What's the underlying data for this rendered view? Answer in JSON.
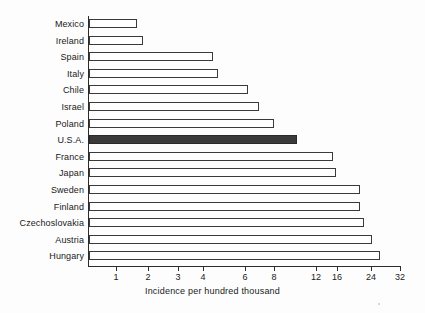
{
  "chart_data": {
    "type": "bar",
    "orientation": "horizontal",
    "title": "",
    "xlabel": "Incidence per hundred thousand",
    "ylabel": "",
    "xscale": "log",
    "xlim": [
      0.9,
      32
    ],
    "grid": false,
    "legend": null,
    "tick_labels": [
      "1",
      "2",
      "3",
      "4",
      "6",
      "8",
      "12",
      "16",
      "24",
      "32"
    ],
    "tick_values": [
      1,
      2,
      3,
      4,
      6,
      8,
      12,
      16,
      24,
      32
    ],
    "tick_px": [
      116,
      148,
      178,
      203,
      245,
      274,
      316,
      337,
      371,
      400
    ],
    "categories": [
      "Mexico",
      "Ireland",
      "Spain",
      "Italy",
      "Chile",
      "Israel",
      "Poland",
      "U.S.A.",
      "France",
      "Japan",
      "Sweden",
      "Finland",
      "Czechoslovakia",
      "Austria",
      "Hungary"
    ],
    "values": [
      1.6,
      1.8,
      4.0,
      4.15,
      6.1,
      6.45,
      7.85,
      10.5,
      14.5,
      15.6,
      20.5,
      20.5,
      22.5,
      23.8,
      25.3
    ],
    "bar_end_px": [
      137,
      143,
      213,
      218,
      248,
      259,
      274,
      297,
      333,
      336,
      360,
      360,
      364,
      372,
      380
    ],
    "highlight_category": "U.S.A.",
    "colors": {
      "bar_fill": "#ffffff",
      "bar_stroke": "#3a3a3a",
      "highlight_fill": "#3a3a3a",
      "axis": "#2b2b2b",
      "text": "#1a1a1a",
      "background": "#fdfdfd"
    }
  }
}
